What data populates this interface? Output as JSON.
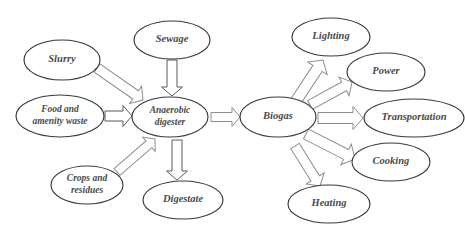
{
  "diagram": {
    "background_color": "#ffffff",
    "node_stroke_color": "#3a3a3a",
    "node_fill_color": "#ffffff",
    "label_color": "#4a4a4a",
    "arrow_stroke_color": "#8d8d8d",
    "nodes": [
      {
        "id": "slurry",
        "label": "Slurry",
        "cx": 62,
        "cy": 60,
        "rx": 38,
        "ry": 20,
        "font_size": 10.5,
        "lines": [
          "Slurry"
        ]
      },
      {
        "id": "sewage",
        "label": "Sewage",
        "cx": 172,
        "cy": 40,
        "rx": 38,
        "ry": 19,
        "font_size": 10.5,
        "lines": [
          "Sewage"
        ]
      },
      {
        "id": "food",
        "label": "Food and amenity waste",
        "cx": 60,
        "cy": 116,
        "rx": 44,
        "ry": 21,
        "font_size": 9.5,
        "lines": [
          "Food and",
          "amenity waste"
        ]
      },
      {
        "id": "digester",
        "label": "Anaerobic digester",
        "cx": 170,
        "cy": 117,
        "rx": 38,
        "ry": 20,
        "font_size": 9.5,
        "lines": [
          "Anaerobic",
          "digester"
        ]
      },
      {
        "id": "crops",
        "label": "Crops and residues",
        "cx": 87,
        "cy": 185,
        "rx": 36,
        "ry": 19,
        "font_size": 9.5,
        "lines": [
          "Crops and",
          "residues"
        ]
      },
      {
        "id": "digestate",
        "label": "Digestate",
        "cx": 183,
        "cy": 200,
        "rx": 40,
        "ry": 19,
        "font_size": 10.5,
        "lines": [
          "Digestate"
        ]
      },
      {
        "id": "biogas",
        "label": "Biogas",
        "cx": 278,
        "cy": 117,
        "rx": 38,
        "ry": 20,
        "font_size": 10.5,
        "lines": [
          "Biogas"
        ]
      },
      {
        "id": "lighting",
        "label": "Lighting",
        "cx": 331,
        "cy": 37,
        "rx": 39,
        "ry": 19,
        "font_size": 10.5,
        "lines": [
          "Lighting"
        ]
      },
      {
        "id": "power",
        "label": "Power",
        "cx": 386,
        "cy": 72,
        "rx": 39,
        "ry": 19,
        "font_size": 10.5,
        "lines": [
          "Power"
        ]
      },
      {
        "id": "transportation",
        "label": "Transportation",
        "cx": 414,
        "cy": 118,
        "rx": 50,
        "ry": 19,
        "font_size": 10.5,
        "lines": [
          "Transportation"
        ]
      },
      {
        "id": "cooking",
        "label": "Cooking",
        "cx": 391,
        "cy": 162,
        "rx": 39,
        "ry": 19,
        "font_size": 10.5,
        "lines": [
          "Cooking"
        ]
      },
      {
        "id": "heating",
        "label": "Heating",
        "cx": 329,
        "cy": 204,
        "rx": 41,
        "ry": 19,
        "font_size": 10.5,
        "lines": [
          "Heating"
        ]
      }
    ],
    "arrows": [
      {
        "id": "slurry-to-digester",
        "from": "slurry",
        "to": "digester",
        "x1": 97,
        "y1": 68,
        "x2": 143,
        "y2": 100,
        "width": 10,
        "head": 9,
        "style": "light"
      },
      {
        "id": "sewage-to-digester",
        "from": "sewage",
        "to": "digester",
        "x1": 172,
        "y1": 60,
        "x2": 172,
        "y2": 96,
        "width": 10,
        "head": 9,
        "style": "dark"
      },
      {
        "id": "food-to-digester",
        "from": "food",
        "to": "digester",
        "x1": 105,
        "y1": 116,
        "x2": 132,
        "y2": 116,
        "width": 10,
        "head": 9,
        "style": "dark"
      },
      {
        "id": "crops-to-digester",
        "from": "crops",
        "to": "digester",
        "x1": 117,
        "y1": 172,
        "x2": 155,
        "y2": 139,
        "width": 9,
        "head": 8,
        "style": "light"
      },
      {
        "id": "digester-to-digestate",
        "from": "digester",
        "to": "digestate",
        "x1": 177,
        "y1": 140,
        "x2": 177,
        "y2": 180,
        "width": 10,
        "head": 9,
        "style": "dark"
      },
      {
        "id": "digester-to-biogas",
        "from": "digester",
        "to": "biogas",
        "x1": 211,
        "y1": 117,
        "x2": 240,
        "y2": 117,
        "width": 9,
        "head": 8,
        "style": "light"
      },
      {
        "id": "biogas-to-lighting",
        "from": "biogas",
        "to": "lighting",
        "x1": 294,
        "y1": 104,
        "x2": 323,
        "y2": 60,
        "width": 11,
        "head": 10,
        "style": "light"
      },
      {
        "id": "biogas-to-power",
        "from": "biogas",
        "to": "power",
        "x1": 310,
        "y1": 105,
        "x2": 352,
        "y2": 82,
        "width": 10,
        "head": 9,
        "style": "light"
      },
      {
        "id": "biogas-to-transportation",
        "from": "biogas",
        "to": "transportation",
        "x1": 318,
        "y1": 118,
        "x2": 363,
        "y2": 118,
        "width": 11,
        "head": 10,
        "style": "light"
      },
      {
        "id": "biogas-to-cooking",
        "from": "biogas",
        "to": "cooking",
        "x1": 306,
        "y1": 134,
        "x2": 355,
        "y2": 159,
        "width": 11,
        "head": 10,
        "style": "light"
      },
      {
        "id": "biogas-to-heating",
        "from": "biogas",
        "to": "heating",
        "x1": 295,
        "y1": 146,
        "x2": 320,
        "y2": 186,
        "width": 10,
        "head": 9,
        "style": "light"
      }
    ]
  }
}
